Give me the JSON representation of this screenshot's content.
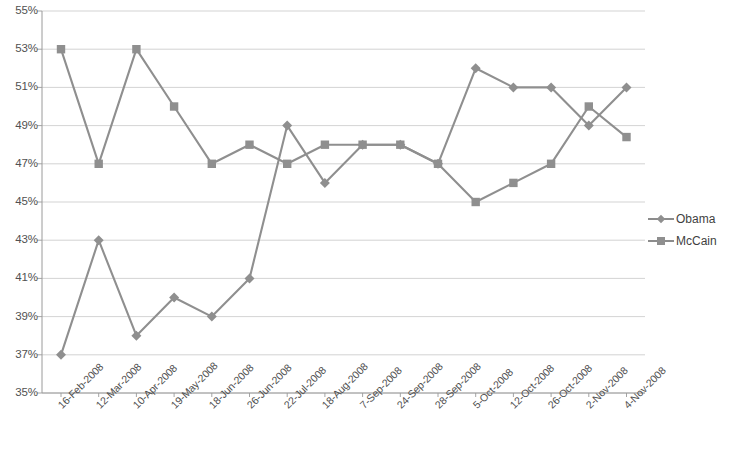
{
  "chart_data": {
    "type": "line",
    "title": "",
    "xlabel": "",
    "ylabel": "",
    "ylim": [
      35,
      55
    ],
    "ytick_step": 2,
    "grid": true,
    "legend_position": "right",
    "value_suffix": "%",
    "categories": [
      "16-Feb-2008",
      "12-Mar-2008",
      "10-Apr-2008",
      "19-May-2008",
      "18-Jun-2008",
      "26-Jun-2008",
      "22-Jul-2008",
      "18-Aug-2008",
      "7-Sep-2008",
      "24-Sep-2008",
      "28-Sep-2008",
      "5-Oct-2008",
      "12-Oct-2008",
      "26-Oct-2008",
      "2-Nov-2008",
      "4-Nov-2008"
    ],
    "ytick_labels": [
      "55%",
      "53%",
      "51%",
      "49%",
      "47%",
      "45%",
      "43%",
      "41%",
      "39%",
      "37%",
      "35%"
    ],
    "series": [
      {
        "name": "Obama",
        "marker": "diamond",
        "color": "#8f8f8f",
        "values": [
          37,
          43,
          38,
          40,
          39,
          41,
          49,
          46,
          48,
          48,
          47,
          52,
          51,
          51,
          49,
          51
        ]
      },
      {
        "name": "McCain",
        "marker": "square",
        "color": "#8f8f8f",
        "values": [
          53,
          47,
          53,
          50,
          47,
          48,
          47,
          48,
          48,
          48,
          47,
          45,
          46,
          47,
          50,
          48.4
        ]
      }
    ]
  },
  "legend": {
    "items": [
      {
        "label": "Obama",
        "marker": "diamond"
      },
      {
        "label": "McCain",
        "marker": "square"
      }
    ]
  },
  "colors": {
    "line": "#8c8c8c",
    "marker": "#8f8f8f",
    "grid": "#c8c8c8",
    "axis": "#9a9a9a",
    "text": "#4a4a4a",
    "background": "#ffffff"
  }
}
